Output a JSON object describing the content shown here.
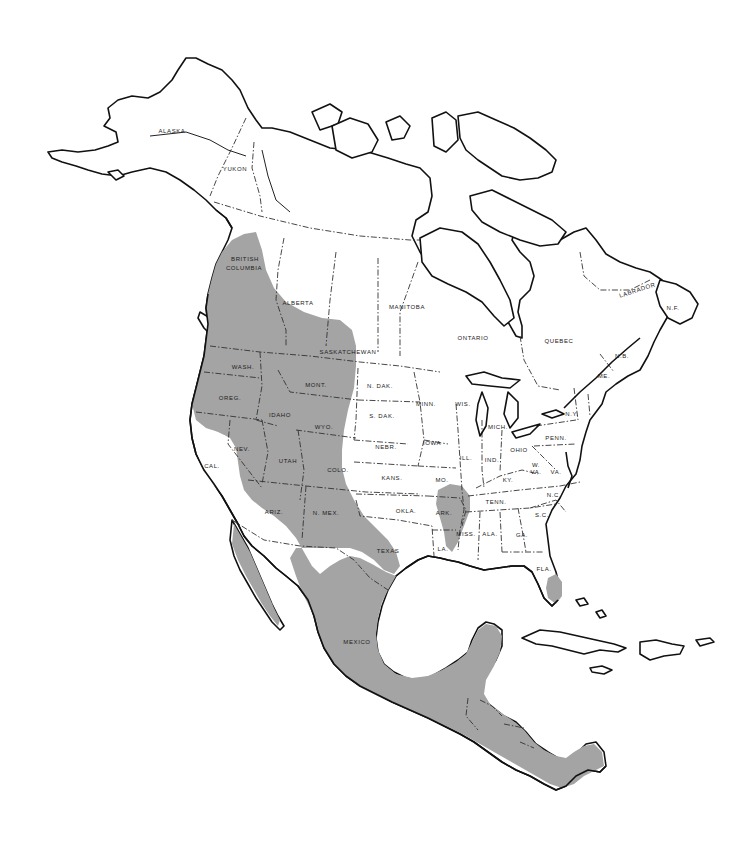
{
  "map": {
    "type": "species range map (black and white)",
    "region": "North and Central America",
    "range_color": "#a4a4a4",
    "outline_color": "#111111",
    "background_color": "#ffffff",
    "labels": {
      "alaska": "ALASKA",
      "yukon": "YUKON",
      "british_columbia_1": "BRITISH",
      "british_columbia_2": "COLUMBIA",
      "alberta": "ALBERTA",
      "saskatchewan": "SASKATCHEWAN",
      "manitoba": "MANITOBA",
      "ontario": "ONTARIO",
      "quebec": "QUEBEC",
      "labrador": "LABRADOR",
      "nf": "N.F.",
      "nb": "N.B.",
      "me": "ME.",
      "ny": "N.Y.",
      "wash": "WASH.",
      "oreg": "OREG.",
      "idaho": "IDAHO",
      "mont": "MONT.",
      "wyo": "WYO.",
      "n_dak": "N. DAK.",
      "s_dak": "S. DAK.",
      "minn": "MINN.",
      "wis": "WIS.",
      "mich": "MICH.",
      "iowa": "IOWA",
      "nebr": "NEBR.",
      "cal": "CAL.",
      "nev": "NEV.",
      "utah": "UTAH",
      "colo": "COLO.",
      "kans": "KANS.",
      "mo": "MO.",
      "ill": "ILL.",
      "ind": "IND.",
      "ohio": "OHIO",
      "penn": "PENN.",
      "w_va_1": "W.",
      "w_va_2": "VA.",
      "va": "VA.",
      "ky": "KY.",
      "tenn": "TENN.",
      "nc": "N.C.",
      "sc": "S.C.",
      "ariz": "ARIZ.",
      "n_mex": "N. MEX.",
      "okla": "OKLA.",
      "ark": "ARK.",
      "texas": "TEXAS",
      "la": "LA.",
      "miss": "MISS.",
      "ala": "ALA.",
      "ga": "GA.",
      "fla": "FLA.",
      "mexico": "MEXICO"
    }
  }
}
